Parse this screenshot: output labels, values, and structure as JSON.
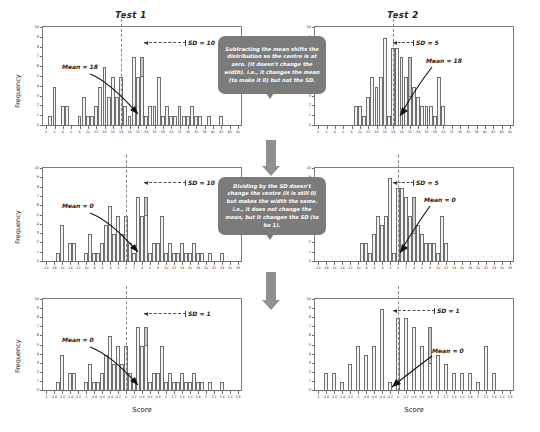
{
  "figure": {
    "title_row": [
      "Test 1",
      "Test 2"
    ],
    "y_axis_label": "Frequency",
    "x_axis_label": "Score",
    "accent_bubble_color": "#7b7b7b",
    "bar_fill_color": "#f4f4f4",
    "bar_stroke_color": "#6f6f6f",
    "mean_line_color": "#8a8a8a"
  },
  "bubbles": [
    {
      "id": "bubble-subtract-mean",
      "text": "Subtracting the mean shifts the distribution so the centre is at zero. (It doesn't change the width). i.e., it changes the mean (to make it 0) but not the SD."
    },
    {
      "id": "bubble-divide-sd",
      "text": "Dividing by the SD doesn't change the centre (it is still 0) but makes the width the same. i.e., it does not change the mean, but it changes the SD (to be 1)."
    }
  ],
  "chart_data": [
    {
      "id": "panel-r1c1",
      "type": "bar",
      "title": "Test 1",
      "xlabel": "",
      "ylabel": "Frequency",
      "ylim": [
        0,
        10
      ],
      "yticks": [
        0,
        1,
        2,
        3,
        4,
        5,
        6,
        7,
        8,
        9,
        10
      ],
      "xlim": [
        -1,
        47
      ],
      "xticks": [
        0,
        2,
        4,
        6,
        8,
        10,
        12,
        14,
        16,
        18,
        20,
        22,
        24,
        26,
        28,
        30,
        32,
        34,
        36,
        38,
        40,
        42,
        44,
        46
      ],
      "mean": 18,
      "sd": 10,
      "mean_annotation": "Mean = 18",
      "sd_annotation": "SD = 10",
      "x": [
        1,
        2,
        3,
        4,
        5,
        6,
        7,
        8,
        9,
        10,
        11,
        12,
        13,
        14,
        15,
        16,
        17,
        18,
        19,
        20,
        21,
        22,
        23,
        24,
        25,
        26,
        27,
        28,
        29,
        30,
        31,
        32,
        33,
        34,
        35,
        36,
        37,
        38,
        39,
        40,
        41,
        42,
        43,
        44,
        45,
        46
      ],
      "values": [
        1,
        4,
        0,
        2,
        2,
        0,
        0,
        1,
        3,
        1,
        1,
        2,
        4,
        6,
        3,
        5,
        3,
        5,
        2,
        1,
        7,
        5,
        7,
        1,
        2,
        2,
        5,
        1,
        2,
        1,
        1,
        2,
        1,
        1,
        2,
        1,
        1,
        0,
        1,
        0,
        0,
        1,
        0,
        0,
        0,
        0
      ]
    },
    {
      "id": "panel-r1c2",
      "type": "bar",
      "title": "Test 2",
      "xlabel": "",
      "ylabel": "",
      "ylim": [
        0,
        10
      ],
      "yticks": [
        0,
        1,
        2,
        3,
        4,
        5,
        6,
        7,
        8,
        9,
        10
      ],
      "xlim": [
        -1,
        47
      ],
      "xticks": [
        0,
        2,
        4,
        6,
        8,
        10,
        12,
        14,
        16,
        18,
        20,
        22,
        24,
        26,
        28,
        30,
        32,
        34,
        36,
        38,
        40,
        42,
        44,
        46
      ],
      "mean": 18,
      "sd": 5,
      "mean_annotation": "Mean = 18",
      "sd_annotation": "SD = 5",
      "x": [
        9,
        10,
        11,
        12,
        13,
        14,
        15,
        16,
        17,
        18,
        19,
        20,
        21,
        22,
        23,
        24,
        25,
        26,
        27,
        28,
        29,
        30
      ],
      "values": [
        2,
        2,
        1,
        3,
        5,
        4,
        5,
        9,
        1,
        8,
        8,
        7,
        5,
        7,
        4,
        3,
        2,
        2,
        2,
        1,
        5,
        2
      ]
    },
    {
      "id": "panel-r2c1",
      "type": "bar",
      "title": "",
      "xlabel": "",
      "ylabel": "Frequency",
      "ylim": [
        0,
        10
      ],
      "yticks": [
        0,
        1,
        2,
        3,
        4,
        5,
        6,
        7,
        8,
        9,
        10
      ],
      "xlim": [
        -21,
        29
      ],
      "xticks": [
        -20,
        -18,
        -16,
        -14,
        -12,
        -10,
        -8,
        -6,
        -4,
        -2,
        0,
        2,
        4,
        6,
        8,
        10,
        12,
        14,
        16,
        18,
        20,
        22,
        24,
        26,
        28
      ],
      "mean": 0,
      "sd": 10,
      "mean_annotation": "Mean = 0",
      "sd_annotation": "SD = 10",
      "x": [
        -17,
        -16,
        -15,
        -14,
        -13,
        -12,
        -11,
        -10,
        -9,
        -8,
        -7,
        -6,
        -5,
        -4,
        -3,
        -2,
        -1,
        0,
        1,
        2,
        3,
        4,
        5,
        6,
        7,
        8,
        9,
        10,
        11,
        12,
        13,
        14,
        15,
        16,
        17,
        18,
        19,
        20,
        21,
        22,
        23,
        24,
        25,
        26,
        27,
        28
      ],
      "values": [
        1,
        4,
        0,
        2,
        2,
        0,
        0,
        1,
        3,
        1,
        1,
        2,
        4,
        6,
        3,
        5,
        3,
        5,
        2,
        1,
        7,
        5,
        7,
        1,
        2,
        2,
        5,
        1,
        2,
        1,
        1,
        2,
        1,
        1,
        2,
        1,
        1,
        0,
        1,
        0,
        0,
        1,
        0,
        0,
        0,
        0
      ]
    },
    {
      "id": "panel-r2c2",
      "type": "bar",
      "title": "",
      "xlabel": "",
      "ylabel": "",
      "ylim": [
        0,
        10
      ],
      "yticks": [
        0,
        1,
        2,
        3,
        4,
        5,
        6,
        7,
        8,
        9,
        10
      ],
      "xlim": [
        -21,
        29
      ],
      "xticks": [
        -20,
        -18,
        -16,
        -14,
        -12,
        -10,
        -8,
        -6,
        -4,
        -2,
        0,
        2,
        4,
        6,
        8,
        10,
        12,
        14,
        16,
        18,
        20,
        22,
        24,
        26,
        28
      ],
      "mean": 0,
      "sd": 5,
      "mean_annotation": "Mean = 0",
      "sd_annotation": "SD = 5",
      "x": [
        -9,
        -8,
        -7,
        -6,
        -5,
        -4,
        -3,
        -2,
        -1,
        0,
        1,
        2,
        3,
        4,
        5,
        6,
        7,
        8,
        9,
        10,
        11,
        12
      ],
      "values": [
        2,
        2,
        1,
        3,
        5,
        4,
        5,
        9,
        1,
        8,
        8,
        7,
        5,
        7,
        4,
        3,
        2,
        2,
        2,
        1,
        5,
        2
      ]
    },
    {
      "id": "panel-r3c1",
      "type": "bar",
      "title": "",
      "xlabel": "Score",
      "ylabel": "Frequency",
      "ylim": [
        0,
        10
      ],
      "yticks": [
        0,
        1,
        2,
        3,
        4,
        5,
        6,
        7,
        8,
        9,
        10
      ],
      "xlim": [
        -2.1,
        2.9
      ],
      "xticks": [
        -2.0,
        -1.8,
        -1.6,
        -1.4,
        -1.2,
        -1.0,
        -0.8,
        -0.6,
        -0.4,
        -0.2,
        0.0,
        0.2,
        0.4,
        0.6,
        0.8,
        1.0,
        1.2,
        1.4,
        1.6,
        1.8,
        2.0,
        2.2,
        2.4,
        2.6,
        2.8
      ],
      "mean": 0,
      "sd": 1,
      "mean_annotation": "Mean = 0",
      "sd_annotation": "SD = 1",
      "x": [
        -1.7,
        -1.6,
        -1.5,
        -1.4,
        -1.3,
        -1.2,
        -1.1,
        -1.0,
        -0.9,
        -0.8,
        -0.7,
        -0.6,
        -0.5,
        -0.4,
        -0.3,
        -0.2,
        -0.1,
        0.0,
        0.1,
        0.2,
        0.3,
        0.4,
        0.5,
        0.6,
        0.7,
        0.8,
        0.9,
        1.0,
        1.1,
        1.2,
        1.3,
        1.4,
        1.5,
        1.6,
        1.7,
        1.8,
        1.9,
        2.0,
        2.1,
        2.2,
        2.3,
        2.4,
        2.5,
        2.6,
        2.7,
        2.8
      ],
      "values": [
        1,
        4,
        0,
        2,
        2,
        0,
        0,
        1,
        3,
        1,
        1,
        2,
        4,
        6,
        3,
        5,
        3,
        5,
        2,
        1,
        7,
        5,
        7,
        1,
        2,
        2,
        5,
        1,
        2,
        1,
        1,
        2,
        1,
        1,
        2,
        1,
        1,
        0,
        1,
        0,
        0,
        1,
        0,
        0,
        0,
        0
      ]
    },
    {
      "id": "panel-r3c2",
      "type": "bar",
      "title": "",
      "xlabel": "Score",
      "ylabel": "",
      "ylim": [
        0,
        10
      ],
      "yticks": [
        0,
        1,
        2,
        3,
        4,
        5,
        6,
        7,
        8,
        9,
        10
      ],
      "xlim": [
        -2.1,
        2.9
      ],
      "xticks": [
        -2.0,
        -1.8,
        -1.6,
        -1.4,
        -1.2,
        -1.0,
        -0.8,
        -0.6,
        -0.4,
        -0.2,
        0.0,
        0.2,
        0.4,
        0.6,
        0.8,
        1.0,
        1.2,
        1.4,
        1.6,
        1.8,
        2.0,
        2.2,
        2.4,
        2.6,
        2.8
      ],
      "mean": 0,
      "sd": 1,
      "mean_annotation": "Mean = 0",
      "sd_annotation": "SD = 1",
      "x": [
        -1.8,
        -1.6,
        -1.4,
        -1.2,
        -1.0,
        -0.8,
        -0.6,
        -0.4,
        -0.2,
        0.0,
        0.2,
        0.4,
        0.6,
        0.8,
        1.0,
        1.2,
        1.4,
        1.6,
        1.8,
        2.0,
        2.2,
        2.4
      ],
      "values": [
        2,
        2,
        1,
        3,
        5,
        4,
        5,
        9,
        1,
        8,
        8,
        7,
        5,
        7,
        4,
        3,
        2,
        2,
        2,
        1,
        5,
        2
      ]
    }
  ]
}
